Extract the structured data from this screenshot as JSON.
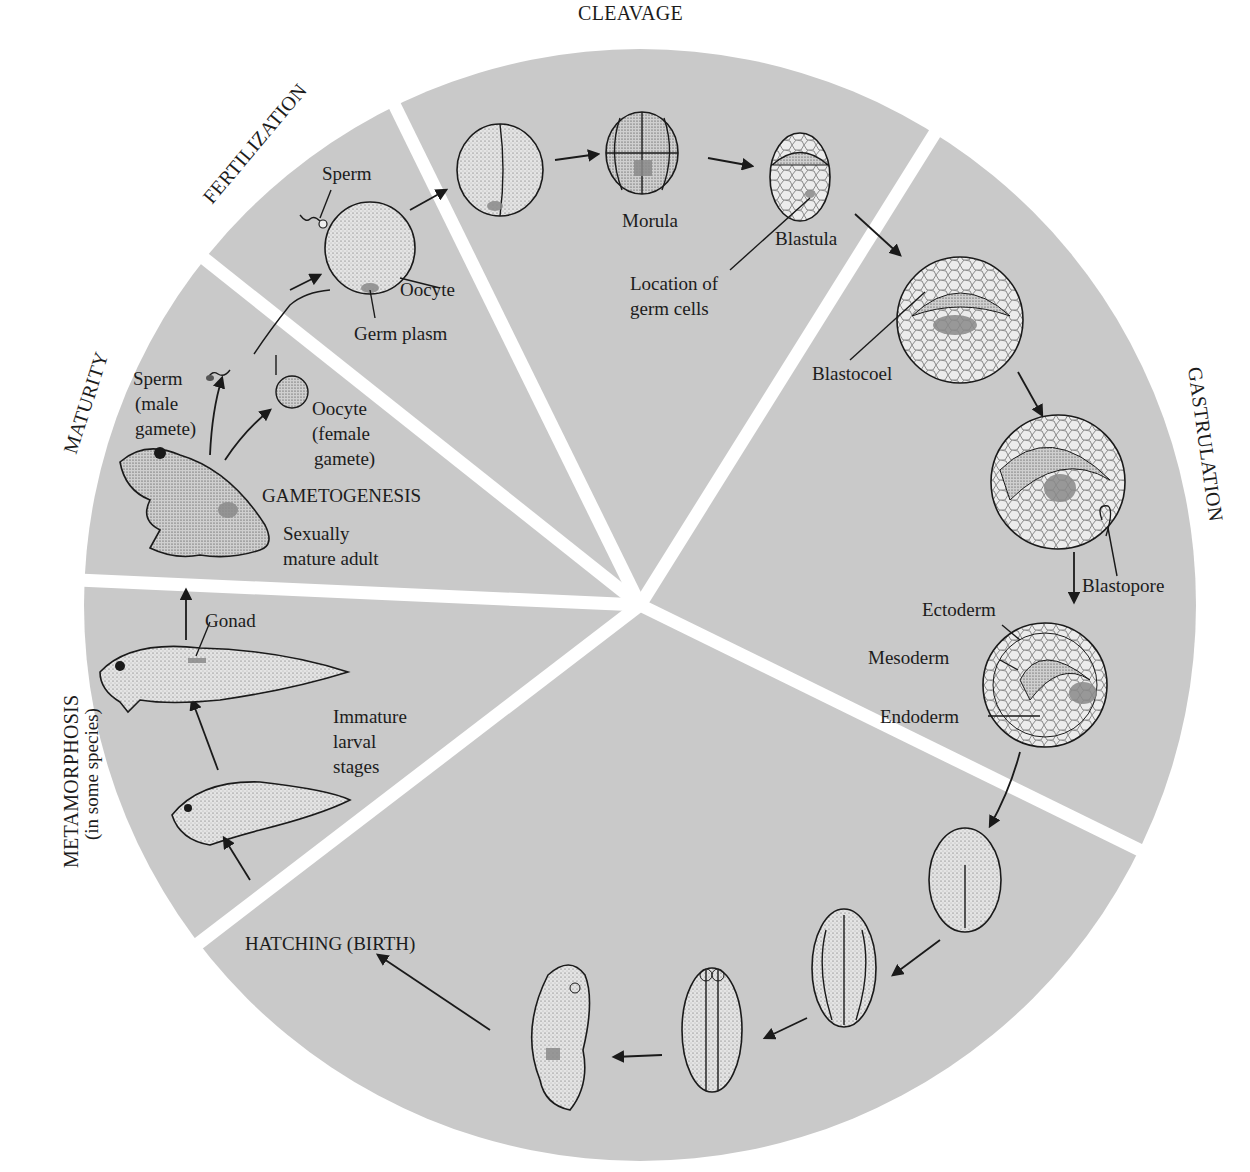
{
  "diagram": {
    "colors": {
      "background": "#ffffff",
      "wheel_fill": "#c9c9c9",
      "divider": "#ffffff",
      "ink": "#1a1a1a",
      "germ_plasm": "#8a8a8a"
    },
    "stages": {
      "cleavage": "CLEAVAGE",
      "fertilization": "FERTILIZATION",
      "maturity": "MATURITY",
      "metamorphosis": "METAMORPHOSIS",
      "metamorphosis_note": "(in some species)",
      "gastrulation": "GASTRULATION",
      "gametogenesis": "GAMETOGENESIS",
      "hatching": "HATCHING (BIRTH)"
    },
    "labels": {
      "sperm": "Sperm",
      "oocyte": "Oocyte",
      "germ_plasm": "Germ plasm",
      "morula": "Morula",
      "blastula": "Blastula",
      "location_of_1": "Location of",
      "location_of_2": "germ cells",
      "blastocoel": "Blastocoel",
      "blastopore": "Blastopore",
      "ectoderm": "Ectoderm",
      "mesoderm": "Mesoderm",
      "endoderm": "Endoderm",
      "sperm_gamete_1": "Sperm",
      "sperm_gamete_2": "(male",
      "sperm_gamete_3": "gamete)",
      "oocyte_gamete_1": "Oocyte",
      "oocyte_gamete_2": "(female",
      "oocyte_gamete_3": "gamete)",
      "adult_1": "Sexually",
      "adult_2": "mature adult",
      "gonad": "Gonad",
      "larval_1": "Immature",
      "larval_2": "larval",
      "larval_3": "stages"
    }
  }
}
